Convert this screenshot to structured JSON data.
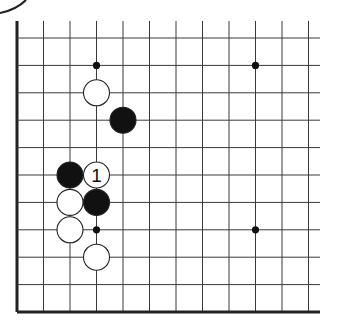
{
  "diagram": {
    "type": "go-board-fragment",
    "visible_columns": 12,
    "visible_rows": 11,
    "edges": [
      "left",
      "bottom"
    ],
    "colors": {
      "line": "#3a3a3a",
      "edge": "#222222",
      "black_stone": "#111111",
      "white_stone": "#ffffff",
      "stone_outline": "#222222"
    },
    "star_points": [
      {
        "col": 3,
        "row": 1
      },
      {
        "col": 9,
        "row": 1
      },
      {
        "col": 3,
        "row": 7
      },
      {
        "col": 9,
        "row": 7
      }
    ],
    "stones": [
      {
        "color": "white",
        "col": 3,
        "row": 2,
        "label": ""
      },
      {
        "color": "black",
        "col": 4,
        "row": 3,
        "label": ""
      },
      {
        "color": "black",
        "col": 2,
        "row": 5,
        "label": ""
      },
      {
        "color": "white",
        "col": 3,
        "row": 5,
        "label": "1"
      },
      {
        "color": "white",
        "col": 2,
        "row": 6,
        "label": ""
      },
      {
        "color": "black",
        "col": 3,
        "row": 6,
        "label": ""
      },
      {
        "color": "white",
        "col": 2,
        "row": 7,
        "label": ""
      },
      {
        "color": "white",
        "col": 3,
        "row": 8,
        "label": ""
      }
    ]
  }
}
